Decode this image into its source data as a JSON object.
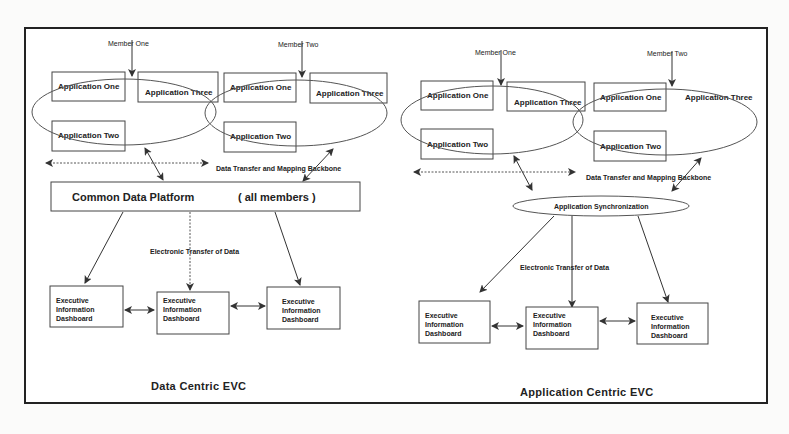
{
  "left": {
    "caption": "Data Centric EVC",
    "member_one": "Member One",
    "member_two": "Member Two",
    "app_one": "Application One",
    "app_two": "Application Two",
    "app_three": "Application Three",
    "backbone": "Data Transfer and Mapping  Backbone",
    "platform": "Common Data Platform",
    "platform_note": "( all members )",
    "transfer": "Electronic Transfer of Data",
    "dash_l1": "Executive",
    "dash_l2": "Information",
    "dash_l3": "Dashboard"
  },
  "right": {
    "caption": "Application Centric EVC",
    "member_one": "Member One",
    "member_two": "Member Two",
    "app_one": "Application One",
    "app_two": "Application Two",
    "app_three": "Application Three",
    "backbone": "Data Transfer and Mapping  Backbone",
    "sync": "Application Synchronization",
    "transfer": "Electronic Transfer of Data",
    "dash_l1": "Executive",
    "dash_l2": "Information",
    "dash_l3": "Dashboard"
  }
}
